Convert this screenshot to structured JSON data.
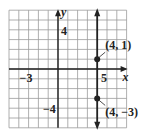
{
  "chart_data": {
    "type": "line",
    "title": "",
    "xlabel": "x",
    "ylabel": "y",
    "xlim": [
      -5,
      7
    ],
    "ylim": [
      -6,
      6
    ],
    "grid": true,
    "tick_labels": {
      "x": [
        {
          "value": -3,
          "label": "−3"
        },
        {
          "value": 5,
          "label": "5"
        }
      ],
      "y": [
        {
          "value": 4,
          "label": "4"
        },
        {
          "value": -4,
          "label": "−4"
        }
      ]
    },
    "series": [
      {
        "name": "x = 4",
        "kind": "vertical-line",
        "x": 4,
        "arrows": "both"
      }
    ],
    "points": [
      {
        "x": 4,
        "y": 1,
        "label": "(4, 1)"
      },
      {
        "x": 4,
        "y": -3,
        "label": "(4, −3)"
      }
    ],
    "colors": {
      "grid": "#9a9a9a",
      "axis": "#222222",
      "line": "#222222",
      "point": "#222222"
    }
  }
}
